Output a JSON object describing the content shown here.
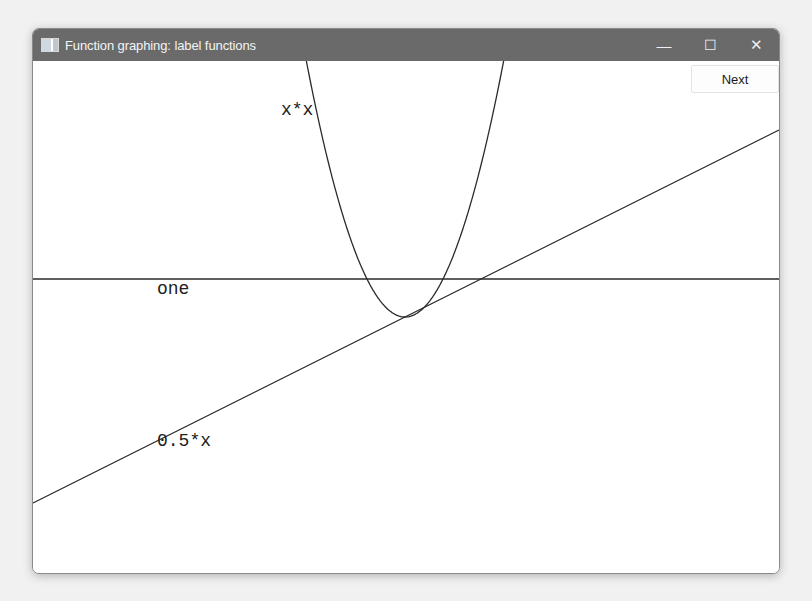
{
  "window": {
    "title": "Function graphing: label functions",
    "controls": {
      "minimize": "—",
      "maximize": "☐",
      "close": "✕"
    }
  },
  "toolbar": {
    "next_label": "Next"
  },
  "chart_data": {
    "type": "line",
    "title": "Function graphing: label functions",
    "xlabel": "",
    "ylabel": "",
    "grid": false,
    "axes_visible": false,
    "origin_px": [
      405,
      317
    ],
    "unit_px": 38,
    "xlim": [
      -9.8,
      9.8
    ],
    "ylim": [
      -6.6,
      6.8
    ],
    "series": [
      {
        "name": "one",
        "expr": "1",
        "label_pos_px": [
          157,
          294
        ]
      },
      {
        "name": "x*x",
        "expr": "x*x",
        "label_pos_px": [
          281,
          115
        ]
      },
      {
        "name": "0.5*x",
        "expr": "0.5*x",
        "label_pos_px": [
          157,
          446
        ]
      }
    ]
  }
}
